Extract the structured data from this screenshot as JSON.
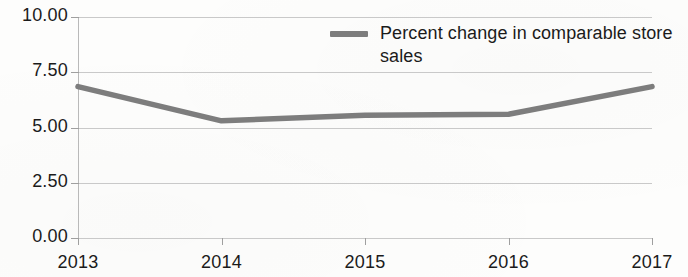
{
  "chart_data": {
    "type": "line",
    "title": "",
    "subtitle": "",
    "xlabel": "",
    "ylabel": "",
    "categories": [
      "2013",
      "2014",
      "2015",
      "2016",
      "2017"
    ],
    "series": [
      {
        "name": "Percent change in comparable store sales",
        "values": [
          6.85,
          5.3,
          5.55,
          5.6,
          6.85
        ],
        "color": "#7d7d7d"
      }
    ],
    "ylim": [
      0.0,
      10.0
    ],
    "ytick_values": [
      10.0,
      7.5,
      5.0,
      2.5,
      0.0
    ],
    "ytick_labels": [
      "10.00",
      "7.50",
      "5.00",
      "2.50",
      "0.00"
    ],
    "xtick_labels": [
      "2013",
      "2014",
      "2015",
      "2016",
      "2017"
    ],
    "grid": "horizontal",
    "legend_position": "top-center-inside",
    "annotations": []
  },
  "legend": {
    "entries": [
      {
        "label": "Percent change in comparable store sales",
        "color": "#7d7d7d",
        "marker": "line-swatch"
      }
    ]
  },
  "colors": {
    "series_line": "#7d7d7d",
    "gridline": "#c9c9c9",
    "axis": "#b9b9b9",
    "tick": "#9f9f9f",
    "text": "#1b1b1b",
    "background": "#fdfdfc"
  }
}
